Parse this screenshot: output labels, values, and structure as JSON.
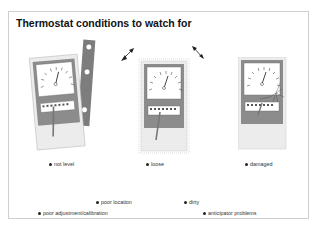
{
  "slide": {
    "title": "Thermostat conditions to watch for"
  },
  "figures": [
    {
      "id": "not-level",
      "caption": "not level"
    },
    {
      "id": "loose",
      "caption": "loose"
    },
    {
      "id": "damaged",
      "caption": "damaged"
    }
  ],
  "bullets": [
    {
      "text": "poor location"
    },
    {
      "text": "dirty"
    },
    {
      "text": "poor adjustment/calibration"
    },
    {
      "text": "anticipator problems"
    }
  ],
  "colors": {
    "body_fill": "#ececec",
    "frame_gray": "#8c8c8c",
    "dial_face": "#ffffff",
    "bracket": "#7d7d7d"
  }
}
